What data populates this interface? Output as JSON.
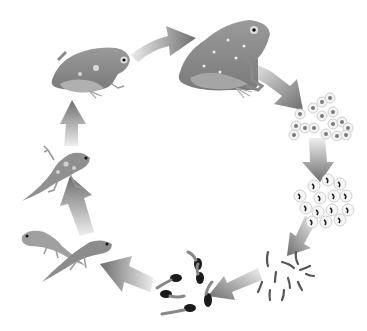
{
  "diagram": {
    "title": "",
    "type": "cycle",
    "background": "#ffffff",
    "colors": {
      "arrow_dark": "#6e6e6e",
      "arrow_light": "#e6e6e6",
      "frog_body": "#8a8a8a",
      "frog_light": "#b5b5b5",
      "frog_spot": "#e8e8e8",
      "egg_ring": "#cfcfcf",
      "egg_core": "#7a7a7a",
      "embryo": "#222222",
      "tadpole": "#555555",
      "tadpole_head": "#1a1a1a"
    },
    "stages": [
      {
        "id": "adult-frog",
        "label": ""
      },
      {
        "id": "eggs",
        "label": ""
      },
      {
        "id": "embryos",
        "label": ""
      },
      {
        "id": "hatchling-tadpoles",
        "label": ""
      },
      {
        "id": "tadpoles",
        "label": ""
      },
      {
        "id": "tadpoles-with-legs",
        "label": ""
      },
      {
        "id": "froglet-with-tail",
        "label": ""
      },
      {
        "id": "young-frog",
        "label": ""
      }
    ],
    "arrows": [
      {
        "from": "young-frog",
        "to": "adult-frog"
      },
      {
        "from": "adult-frog",
        "to": "eggs"
      },
      {
        "from": "eggs",
        "to": "embryos"
      },
      {
        "from": "embryos",
        "to": "hatchling-tadpoles"
      },
      {
        "from": "hatchling-tadpoles",
        "to": "tadpoles"
      },
      {
        "from": "tadpoles",
        "to": "tadpoles-with-legs"
      },
      {
        "from": "tadpoles-with-legs",
        "to": "froglet-with-tail"
      },
      {
        "from": "froglet-with-tail",
        "to": "young-frog"
      }
    ]
  }
}
